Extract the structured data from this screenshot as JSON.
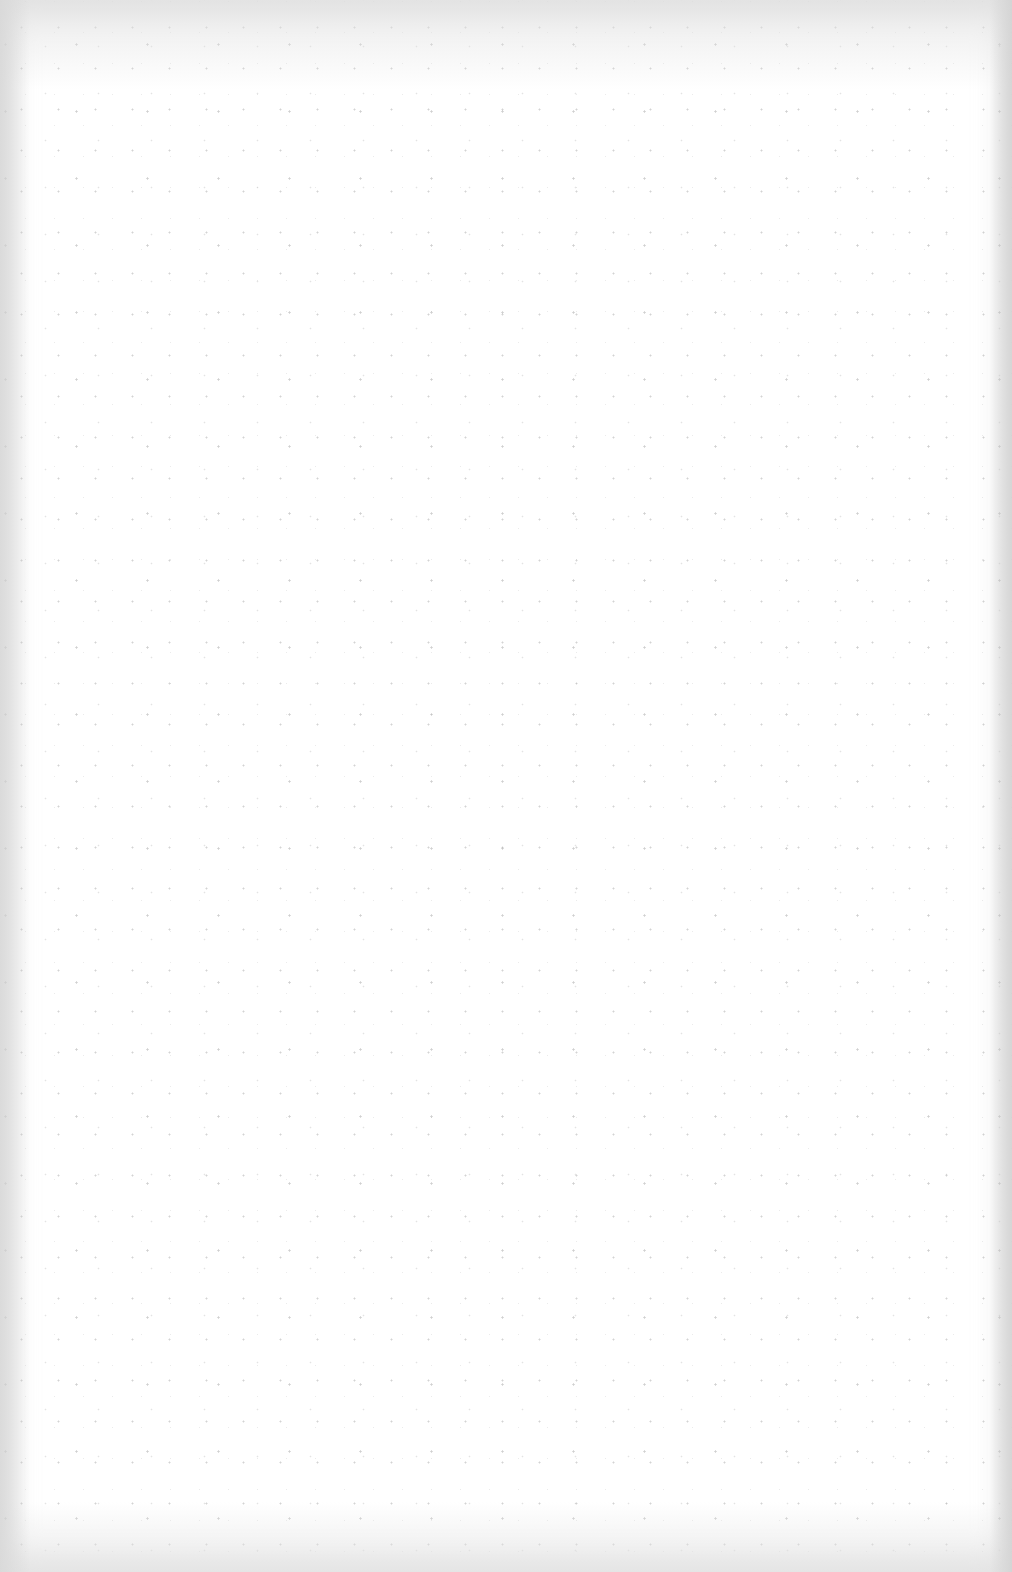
{
  "document": {
    "type": "blank scanned page",
    "content": [],
    "background_color": "#ffffff"
  }
}
